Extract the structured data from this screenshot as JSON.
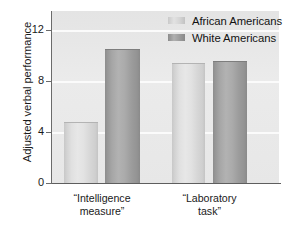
{
  "chart_data": {
    "type": "bar",
    "title": "",
    "xlabel": "",
    "ylabel": "Adjusted verbal performance",
    "categories": [
      "“Intelligence measure”",
      "“Laboratory task”"
    ],
    "category_lines": [
      [
        "“Intelligence",
        "measure”"
      ],
      [
        "“Laboratory",
        "task”"
      ]
    ],
    "series": [
      {
        "name": "African Americans",
        "values": [
          4.7,
          9.35
        ],
        "color": "#dcdcdc"
      },
      {
        "name": "White Americans",
        "values": [
          10.4,
          9.5
        ],
        "color": "#a3a3a3"
      }
    ],
    "ylim": [
      0,
      13
    ],
    "yticks": [
      0,
      4,
      8,
      12
    ],
    "ytick_labels": [
      "0",
      "4",
      "8",
      "12"
    ],
    "grid": true,
    "grid_color": "#fbfbfb",
    "legend_position": "top-right",
    "plot_background": "#e7e7e7"
  }
}
